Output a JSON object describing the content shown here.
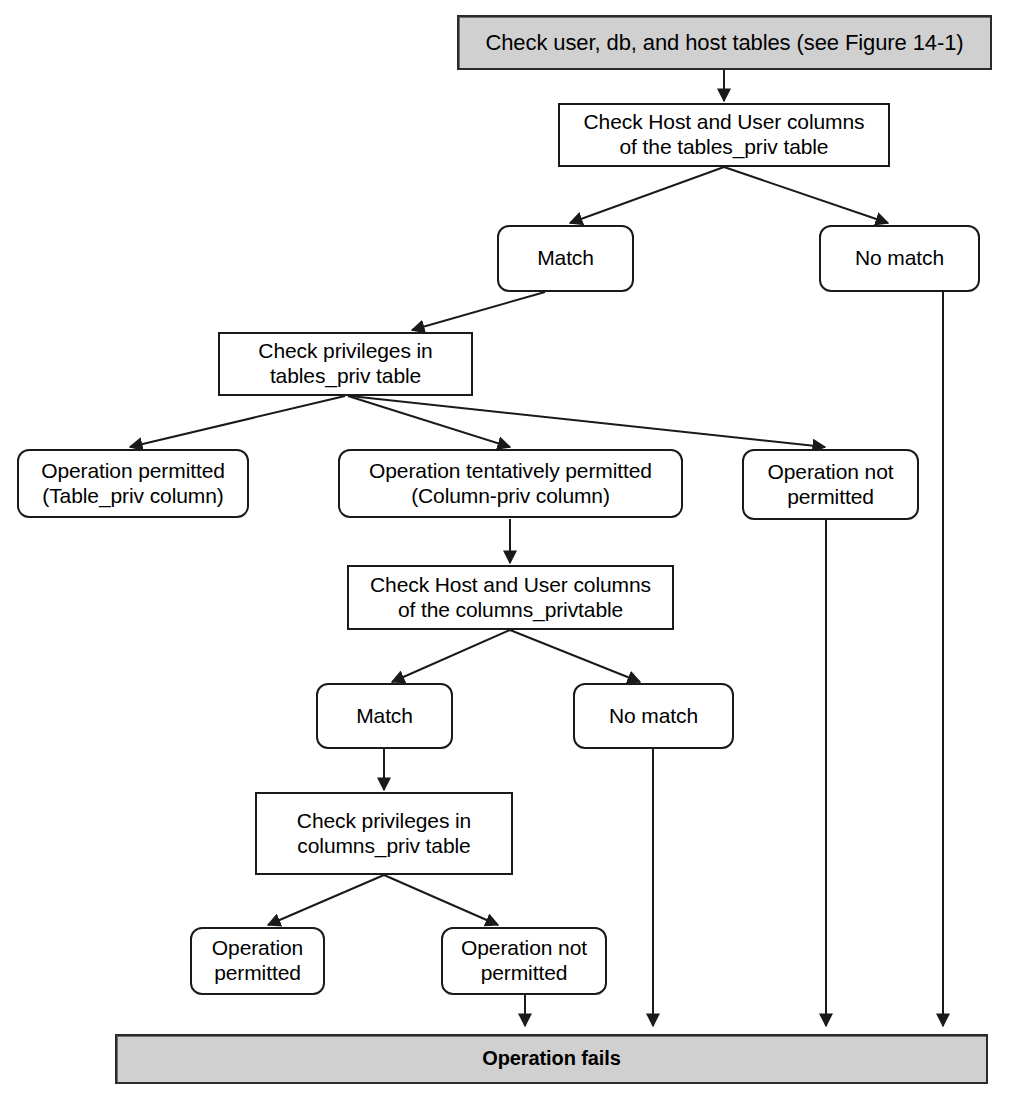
{
  "figure": {
    "colors": {
      "banner_fill": "#d0d0d0",
      "node_fill": "#ffffff",
      "stroke": "#1a1a1a",
      "background": "#ffffff"
    }
  },
  "nodes": {
    "start_banner": "Check user, db, and host tables (see Figure 14-1)",
    "check_tables_priv_cols": "Check Host and User columns\nof the tables_priv table",
    "match_1": "Match",
    "no_match_1": "No match",
    "check_priv_tables_priv": "Check privileges in\ntables_priv table",
    "op_permitted_table_priv": "Operation permitted\n(Table_priv column)",
    "op_tentatively_permitted": "Operation tentatively permitted\n(Column-priv column)",
    "op_not_permitted_1": "Operation not\npermitted",
    "check_columns_priv_cols": "Check Host and User columns\nof the columns_privtable",
    "match_2": "Match",
    "no_match_2": "No match",
    "check_priv_columns_priv": "Check privileges in\ncolumns_priv table",
    "op_permitted_2": "Operation\npermitted",
    "op_not_permitted_2": "Operation not\npermitted",
    "end_banner": "Operation fails"
  },
  "edges": [
    {
      "from": "start_banner",
      "to": "check_tables_priv_cols",
      "style": "arrow"
    },
    {
      "from": "check_tables_priv_cols",
      "to": "match_1",
      "style": "arrow"
    },
    {
      "from": "check_tables_priv_cols",
      "to": "no_match_1",
      "style": "arrow"
    },
    {
      "from": "match_1",
      "to": "check_priv_tables_priv",
      "style": "arrow"
    },
    {
      "from": "check_priv_tables_priv",
      "to": "op_permitted_table_priv",
      "style": "arrow"
    },
    {
      "from": "check_priv_tables_priv",
      "to": "op_tentatively_permitted",
      "style": "arrow"
    },
    {
      "from": "check_priv_tables_priv",
      "to": "op_not_permitted_1",
      "style": "arrow"
    },
    {
      "from": "op_tentatively_permitted",
      "to": "check_columns_priv_cols",
      "style": "arrow"
    },
    {
      "from": "check_columns_priv_cols",
      "to": "match_2",
      "style": "arrow"
    },
    {
      "from": "check_columns_priv_cols",
      "to": "no_match_2",
      "style": "arrow"
    },
    {
      "from": "match_2",
      "to": "check_priv_columns_priv",
      "style": "arrow"
    },
    {
      "from": "check_priv_columns_priv",
      "to": "op_permitted_2",
      "style": "arrow"
    },
    {
      "from": "check_priv_columns_priv",
      "to": "op_not_permitted_2",
      "style": "arrow"
    },
    {
      "from": "op_not_permitted_2",
      "to": "end_banner",
      "style": "arrow"
    },
    {
      "from": "no_match_2",
      "to": "end_banner",
      "style": "arrow"
    },
    {
      "from": "op_not_permitted_1",
      "to": "end_banner",
      "style": "arrow"
    },
    {
      "from": "no_match_1",
      "to": "end_banner",
      "style": "arrow"
    }
  ]
}
